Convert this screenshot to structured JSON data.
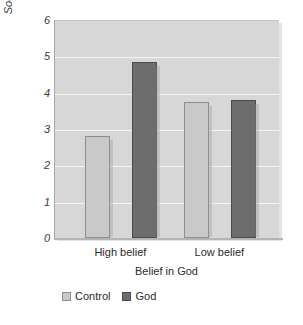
{
  "chart_data": {
    "type": "bar",
    "title": "",
    "xlabel": "Belief in God",
    "ylabel": "Socially Desirable Response",
    "categories": [
      "High belief",
      "Low belief"
    ],
    "series": [
      {
        "name": "Control",
        "color": "#c9c9c9",
        "values": [
          2.8,
          3.75
        ]
      },
      {
        "name": "God",
        "color": "#6d6d6d",
        "values": [
          4.85,
          3.8
        ]
      }
    ],
    "ylim": [
      0,
      6
    ],
    "yticks": [
      0,
      1,
      2,
      3,
      4,
      5,
      6
    ],
    "ytick_labels": [
      "0",
      "1",
      "2",
      "3",
      "4",
      "5",
      "6"
    ],
    "grid": true,
    "grid_color": "#f4f4f4",
    "plot_background": "#d7d7d7",
    "legend_position": "bottom-left"
  }
}
